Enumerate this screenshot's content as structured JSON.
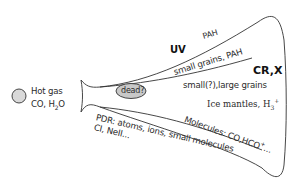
{
  "diagram": {
    "source": {
      "label_line1": "Hot gas",
      "label_line2_prefix": "CO, H",
      "label_line2_sub": "2",
      "label_line2_suffix": "O",
      "circle_fill": "#d9d9d9"
    },
    "core": {
      "label": "dead?",
      "fill": "#c8c8c8"
    },
    "radiation": {
      "uv": "UV",
      "crx": "CR,X"
    },
    "layers": {
      "pah": "PAH",
      "small_grains_pah": "small grains, PAH",
      "small_large_grains": "small(?),large grains",
      "ice_mantles_prefix": "Ice mantles, H",
      "ice_mantles_sub": "3",
      "ice_mantles_sup": "+",
      "molecules_prefix": "Molecules: CO,HCO",
      "molecules_sup": "+",
      "molecules_suffix": "...",
      "pdr_line1": "PDR: atoms, ions, small molecules",
      "pdr_line2": "CI, NeII..."
    },
    "colors": {
      "outline": "#333333",
      "text": "#2b2b2b"
    }
  }
}
